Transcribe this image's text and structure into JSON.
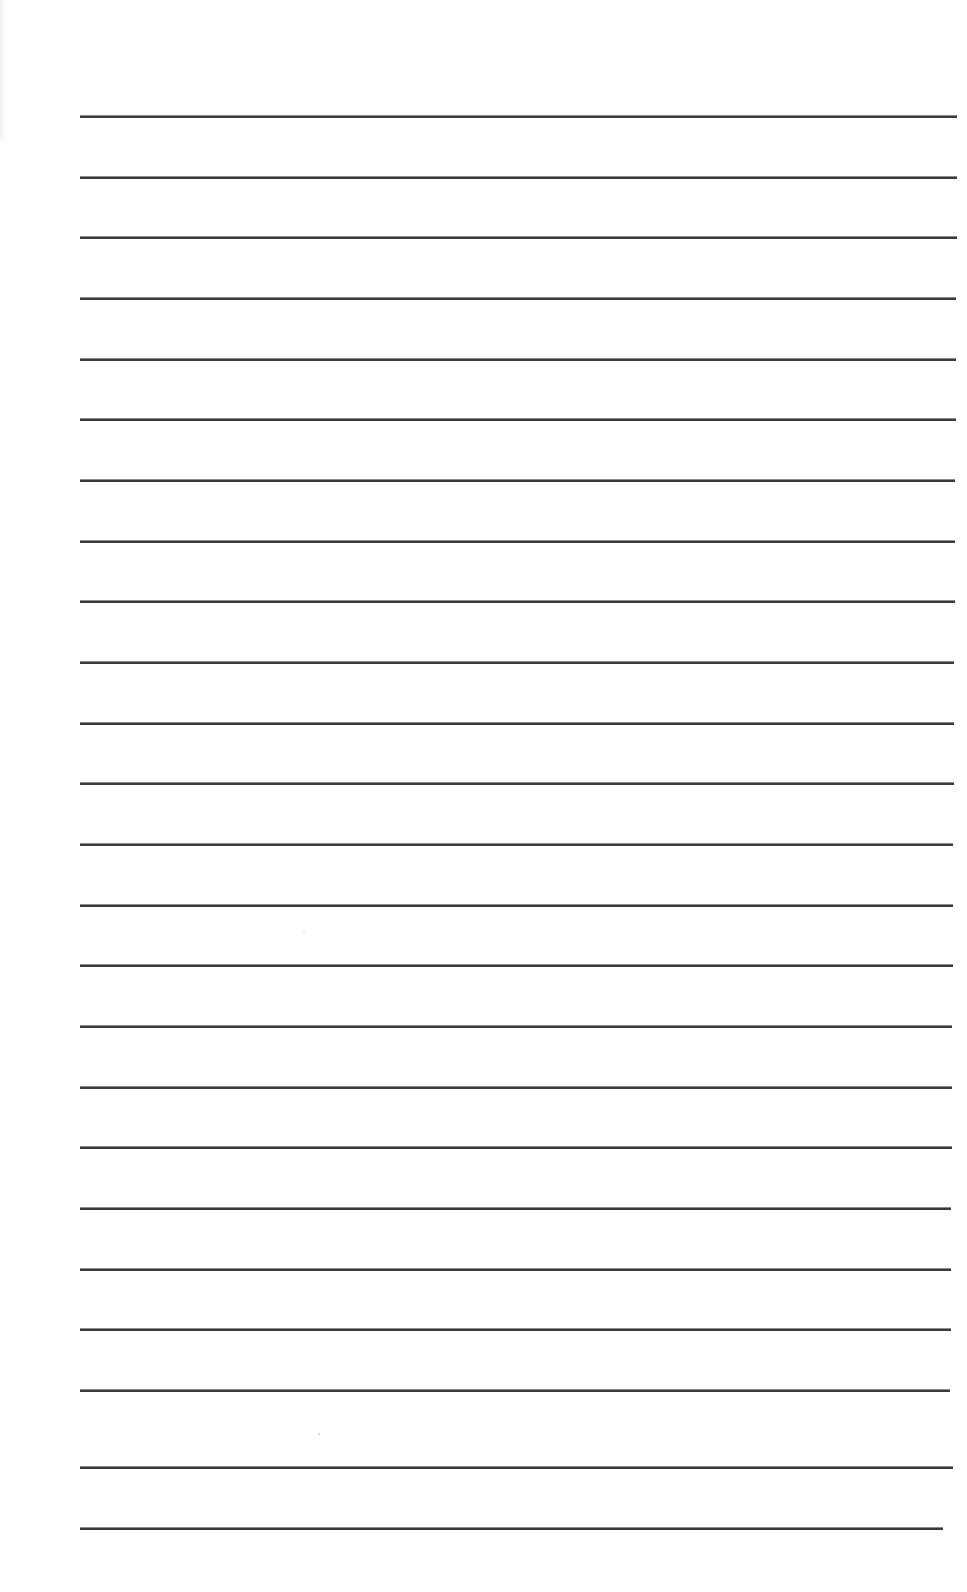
{
  "document": {
    "type": "lined-paper",
    "background_color": "#ffffff",
    "line_color": "#3a3a3a",
    "line_count": 24,
    "lines": [
      {
        "index": 1,
        "y": 116,
        "x_start": 80,
        "x_end": 957
      },
      {
        "index": 2,
        "y": 177,
        "x_start": 80,
        "x_end": 957
      },
      {
        "index": 3,
        "y": 237,
        "x_start": 80,
        "x_end": 957
      },
      {
        "index": 4,
        "y": 298,
        "x_start": 80,
        "x_end": 956
      },
      {
        "index": 5,
        "y": 359,
        "x_start": 80,
        "x_end": 956
      },
      {
        "index": 6,
        "y": 419,
        "x_start": 80,
        "x_end": 956
      },
      {
        "index": 7,
        "y": 480,
        "x_start": 80,
        "x_end": 955
      },
      {
        "index": 8,
        "y": 541,
        "x_start": 80,
        "x_end": 955
      },
      {
        "index": 9,
        "y": 601,
        "x_start": 80,
        "x_end": 955
      },
      {
        "index": 10,
        "y": 662,
        "x_start": 80,
        "x_end": 954
      },
      {
        "index": 11,
        "y": 723,
        "x_start": 80,
        "x_end": 954
      },
      {
        "index": 12,
        "y": 783,
        "x_start": 80,
        "x_end": 954
      },
      {
        "index": 13,
        "y": 844,
        "x_start": 80,
        "x_end": 953
      },
      {
        "index": 14,
        "y": 905,
        "x_start": 80,
        "x_end": 953
      },
      {
        "index": 15,
        "y": 965,
        "x_start": 80,
        "x_end": 953
      },
      {
        "index": 16,
        "y": 1026,
        "x_start": 80,
        "x_end": 952
      },
      {
        "index": 17,
        "y": 1087,
        "x_start": 80,
        "x_end": 952
      },
      {
        "index": 18,
        "y": 1147,
        "x_start": 80,
        "x_end": 952
      },
      {
        "index": 19,
        "y": 1208,
        "x_start": 80,
        "x_end": 951
      },
      {
        "index": 20,
        "y": 1269,
        "x_start": 80,
        "x_end": 951
      },
      {
        "index": 21,
        "y": 1329,
        "x_start": 80,
        "x_end": 951
      },
      {
        "index": 22,
        "y": 1390,
        "x_start": 80,
        "x_end": 950
      },
      {
        "index": 23,
        "y": 1467,
        "x_start": 80,
        "x_end": 953
      },
      {
        "index": 24,
        "y": 1528,
        "x_start": 80,
        "x_end": 943
      }
    ]
  }
}
